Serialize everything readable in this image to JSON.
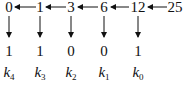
{
  "diagram": {
    "quotients": [
      {
        "value": "0",
        "x": 9
      },
      {
        "value": "1",
        "x": 40
      },
      {
        "value": "3",
        "x": 71
      },
      {
        "value": "6",
        "x": 104
      },
      {
        "value": "12",
        "x": 138
      },
      {
        "value": "25",
        "x": 175
      }
    ],
    "remainders": [
      {
        "value": "1",
        "x": 9
      },
      {
        "value": "1",
        "x": 40
      },
      {
        "value": "0",
        "x": 71
      },
      {
        "value": "0",
        "x": 104
      },
      {
        "value": "1",
        "x": 138
      }
    ],
    "labels": [
      {
        "base": "k",
        "sub": "4",
        "x": 9
      },
      {
        "base": "k",
        "sub": "3",
        "x": 40
      },
      {
        "base": "k",
        "sub": "2",
        "x": 71
      },
      {
        "base": "k",
        "sub": "1",
        "x": 104
      },
      {
        "base": "k",
        "sub": "0",
        "x": 138
      }
    ],
    "line_color": "#111111"
  }
}
